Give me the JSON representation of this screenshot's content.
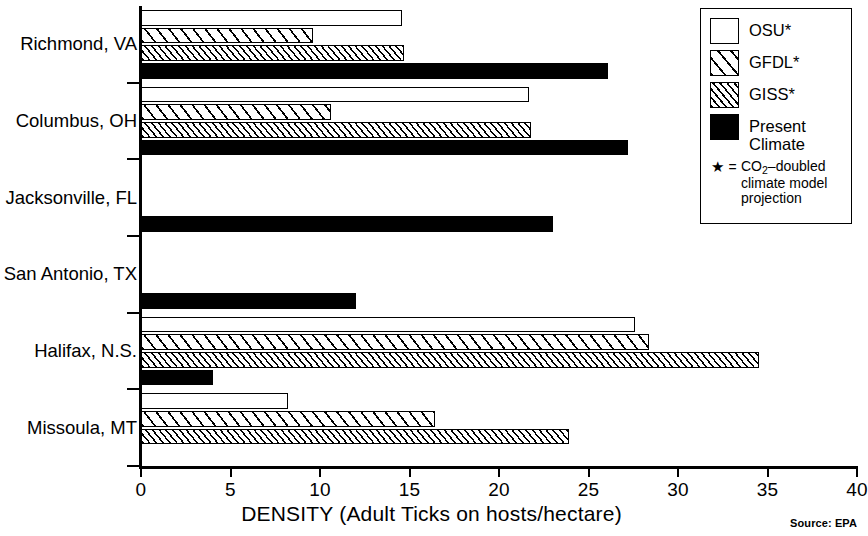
{
  "chart_data": {
    "type": "bar",
    "orientation": "horizontal",
    "title": "",
    "xlabel": "DENSITY (Adult Ticks on hosts/hectare)",
    "ylabel": "",
    "xlim": [
      0,
      40
    ],
    "xticks": [
      0,
      5,
      10,
      15,
      20,
      25,
      30,
      35,
      40
    ],
    "xticklabels": [
      "0",
      "5",
      "10",
      "15",
      "20",
      "25",
      "30",
      "35",
      "40"
    ],
    "grid": false,
    "categories": [
      "Richmond, VA",
      "Columbus, OH",
      "Jacksonville, FL",
      "San Antonio, TX",
      "Halifax, N.S.",
      "Missoula, MT"
    ],
    "series": [
      {
        "name": "OSU*",
        "key": "osu",
        "values": [
          14.6,
          21.7,
          0,
          0,
          27.6,
          8.2
        ]
      },
      {
        "name": "GFDL*",
        "key": "gfdl",
        "values": [
          9.6,
          10.6,
          0,
          0,
          28.4,
          16.4
        ]
      },
      {
        "name": "GISS*",
        "key": "giss",
        "values": [
          14.7,
          21.8,
          0,
          0,
          34.5,
          23.9
        ]
      },
      {
        "name": "Present Climate",
        "key": "present",
        "values": [
          26.1,
          27.2,
          23.0,
          12.0,
          4.0,
          0
        ]
      }
    ],
    "legend_position": "top-right",
    "source": "Source: EPA"
  },
  "legend": {
    "items": [
      {
        "label": "OSU*",
        "swatch": "white-open-square"
      },
      {
        "label": "GFDL*",
        "swatch": "wide-hatch-square"
      },
      {
        "label": "GISS*",
        "swatch": "fine-hatch-square"
      },
      {
        "label": "Present Climate",
        "swatch": "solid-black-square"
      }
    ],
    "note": {
      "star": "★",
      "equals": "=",
      "line1_pre": "CO",
      "line1_sub": "2",
      "line1_post": "–doubled",
      "line2": "climate model",
      "line3": "projection"
    }
  },
  "axis": {
    "title": "DENSITY (Adult Ticks on hosts/hectare)"
  },
  "footer": {
    "source": "Source: EPA"
  },
  "colors": {
    "ink": "#000000",
    "paper": "#ffffff"
  }
}
